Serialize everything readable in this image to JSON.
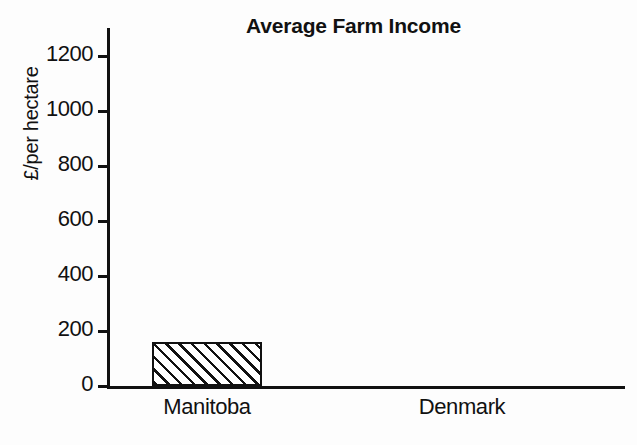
{
  "chart_data": {
    "type": "bar",
    "title": "Average Farm Income",
    "xlabel": "",
    "ylabel": "£/per hectare",
    "categories": [
      "Manitoba",
      "Denmark"
    ],
    "values": [
      160,
      0
    ],
    "ylim": [
      0,
      1300
    ],
    "y_ticks": [
      0,
      200,
      400,
      600,
      800,
      1000,
      1200
    ],
    "y_tick_labels": [
      "0",
      "200",
      "400",
      "600",
      "800",
      "1000",
      "1200"
    ],
    "grid": false,
    "legend": null,
    "series": [
      {
        "name": "Average Farm Income",
        "values": [
          160,
          0
        ],
        "fill": "diagonal-hatch",
        "color": "#111111"
      }
    ],
    "annotations": []
  },
  "style": {
    "background": "#fdfdfd",
    "ink": "#111111",
    "bar_fill": "#ffffff",
    "hatch_color": "#111111"
  }
}
